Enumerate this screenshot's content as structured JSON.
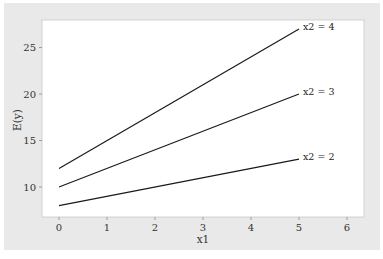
{
  "chart_data": {
    "type": "line",
    "title": "",
    "xlabel": "x1",
    "ylabel": "E(y)",
    "xlim": [
      -0.35,
      6.35
    ],
    "ylim": [
      7.0,
      28.3
    ],
    "x_ticks": [
      "0",
      "1",
      "2",
      "3",
      "4",
      "5",
      "6"
    ],
    "y_ticks": [
      "10",
      "15",
      "20",
      "25"
    ],
    "grid": false,
    "legend": "inline labels at line ends",
    "x": [
      0,
      5
    ],
    "series": [
      {
        "name": "x2 = 2",
        "values": [
          8,
          13
        ]
      },
      {
        "name": "x2 = 3",
        "values": [
          10,
          20
        ]
      },
      {
        "name": "x2 = 4",
        "values": [
          12,
          27
        ]
      }
    ]
  },
  "colors": {
    "background": "#e9e9e9",
    "plot_area": "#ffffff",
    "line": "#1a1a1a"
  }
}
